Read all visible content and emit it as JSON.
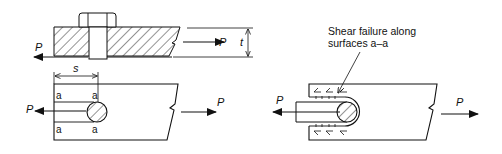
{
  "figure": {
    "type": "engineering-diagram",
    "colors": {
      "ink": "#111111",
      "background": "#ffffff"
    }
  },
  "top_view": {
    "load_left": "P",
    "load_right": "P",
    "thickness_label": "t"
  },
  "bottom_left_view": {
    "edge_distance_label": "s",
    "load_left": "P",
    "load_right": "P",
    "surface_labels": [
      "a",
      "a",
      "a",
      "a"
    ]
  },
  "bottom_right_view": {
    "annotation_line1": "Shear failure along",
    "annotation_line2": "surfaces a–a",
    "load_left": "P",
    "load_right": "P"
  }
}
